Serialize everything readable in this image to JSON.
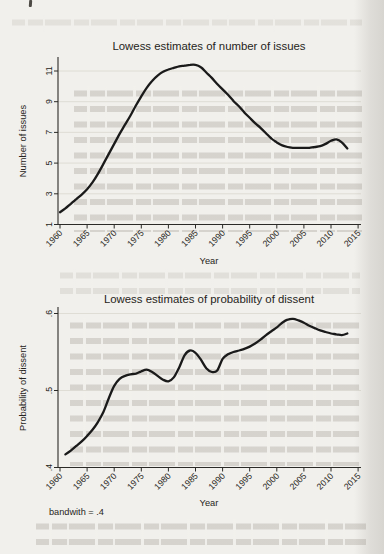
{
  "chart_data": [
    {
      "type": "line",
      "title": "Lowess estimates of number of issues",
      "xlabel": "Year",
      "ylabel": "Number of issues",
      "x_tick_labels": [
        "1960",
        "1965",
        "1970",
        "1975",
        "1980",
        "1985",
        "1990",
        "1995",
        "2000",
        "2005",
        "2010",
        "2015"
      ],
      "y_tick_labels": [
        "1",
        "3",
        "5",
        "7",
        "9",
        "11"
      ],
      "xlim": [
        1960,
        2016
      ],
      "ylim": [
        1,
        11.9
      ],
      "grid": true,
      "legend": "none",
      "line_color": "#1a1a1a",
      "series": [
        {
          "name": "lowess smooth",
          "x": [
            1960,
            1961,
            1962,
            1963,
            1964,
            1965,
            1966,
            1967,
            1968,
            1969,
            1970,
            1971,
            1972,
            1973,
            1974,
            1975,
            1976,
            1977,
            1978,
            1979,
            1980,
            1981,
            1982,
            1983,
            1984,
            1985,
            1986,
            1987,
            1988,
            1989,
            1990,
            1991,
            1992,
            1993,
            1994,
            1995,
            1996,
            1997,
            1998,
            1999,
            2000,
            2001,
            2002,
            2003,
            2004,
            2005,
            2006,
            2007,
            2008,
            2009,
            2010,
            2011,
            2012,
            2013
          ],
          "y": [
            1.8,
            2.05,
            2.35,
            2.65,
            2.95,
            3.3,
            3.75,
            4.3,
            4.95,
            5.6,
            6.25,
            6.9,
            7.5,
            8.1,
            8.75,
            9.35,
            9.9,
            10.35,
            10.7,
            10.95,
            11.1,
            11.2,
            11.3,
            11.35,
            11.4,
            11.4,
            11.25,
            10.9,
            10.55,
            10.15,
            9.8,
            9.45,
            9.05,
            8.7,
            8.3,
            7.95,
            7.6,
            7.3,
            6.95,
            6.6,
            6.35,
            6.15,
            6.05,
            6.0,
            6.0,
            6.0,
            6.0,
            6.05,
            6.1,
            6.25,
            6.45,
            6.55,
            6.35,
            5.95
          ]
        }
      ]
    },
    {
      "type": "line",
      "title": "Lowess estimates of probability of dissent",
      "xlabel": "Year",
      "ylabel": "Probability of dissent",
      "x_tick_labels": [
        "1960",
        "1965",
        "1970",
        "1975",
        "1980",
        "1985",
        "1990",
        "1995",
        "2000",
        "2005",
        "2010",
        "2015"
      ],
      "y_tick_labels": [
        ".4",
        ".5",
        ".6"
      ],
      "xlim": [
        1960,
        2016
      ],
      "ylim": [
        0.4,
        0.605
      ],
      "grid": true,
      "legend": "none",
      "line_color": "#1a1a1a",
      "note": "bandwith = .4",
      "series": [
        {
          "name": "lowess smooth",
          "x": [
            1961,
            1962,
            1963,
            1964,
            1965,
            1966,
            1967,
            1968,
            1969,
            1970,
            1971,
            1972,
            1973,
            1974,
            1975,
            1976,
            1977,
            1978,
            1979,
            1980,
            1981,
            1982,
            1983,
            1984,
            1985,
            1986,
            1987,
            1988,
            1989,
            1990,
            1991,
            1992,
            1993,
            1994,
            1995,
            1996,
            1997,
            1998,
            1999,
            2000,
            2001,
            2002,
            2003,
            2004,
            2005,
            2006,
            2007,
            2008,
            2009,
            2010,
            2011,
            2012,
            2013
          ],
          "y": [
            0.417,
            0.422,
            0.428,
            0.434,
            0.441,
            0.449,
            0.459,
            0.472,
            0.49,
            0.506,
            0.515,
            0.519,
            0.521,
            0.522,
            0.525,
            0.527,
            0.524,
            0.519,
            0.514,
            0.512,
            0.517,
            0.53,
            0.546,
            0.552,
            0.549,
            0.54,
            0.529,
            0.524,
            0.526,
            0.541,
            0.547,
            0.55,
            0.552,
            0.554,
            0.557,
            0.561,
            0.566,
            0.572,
            0.577,
            0.582,
            0.588,
            0.592,
            0.593,
            0.591,
            0.588,
            0.584,
            0.581,
            0.578,
            0.576,
            0.574,
            0.573,
            0.572,
            0.574
          ]
        }
      ]
    }
  ]
}
